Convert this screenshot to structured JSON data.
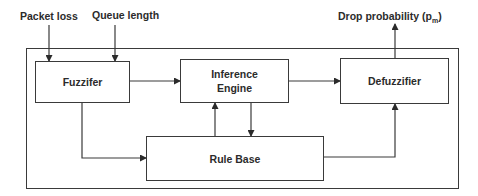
{
  "diagram": {
    "inputs": [
      {
        "id": "packet-loss",
        "label": "Packet loss"
      },
      {
        "id": "queue-length",
        "label": "Queue length"
      }
    ],
    "output": {
      "label": "Drop probability (p",
      "subscript": "m",
      "suffix": ")"
    },
    "blocks": {
      "fuzzifier": {
        "label": "Fuzzifer"
      },
      "inference": {
        "line1": "Inference",
        "line2": "Engine"
      },
      "defuzzifier": {
        "label": "Defuzzifier"
      },
      "rule_base": {
        "label": "Rule Base"
      }
    },
    "edges": [
      {
        "from": "Packet loss",
        "to": "Fuzzifer"
      },
      {
        "from": "Queue length",
        "to": "Fuzzifer"
      },
      {
        "from": "Fuzzifer",
        "to": "Inference Engine"
      },
      {
        "from": "Inference Engine",
        "to": "Defuzzifier"
      },
      {
        "from": "Fuzzifer",
        "to": "Rule Base"
      },
      {
        "from": "Rule Base",
        "to": "Inference Engine"
      },
      {
        "from": "Inference Engine",
        "to": "Rule Base"
      },
      {
        "from": "Rule Base",
        "to": "Defuzzifier"
      },
      {
        "from": "Defuzzifier",
        "to": "Drop probability (pm)"
      }
    ],
    "colors": {
      "stroke": "#3a3a3a",
      "text": "#2b2b2b",
      "background": "#ffffff"
    }
  }
}
